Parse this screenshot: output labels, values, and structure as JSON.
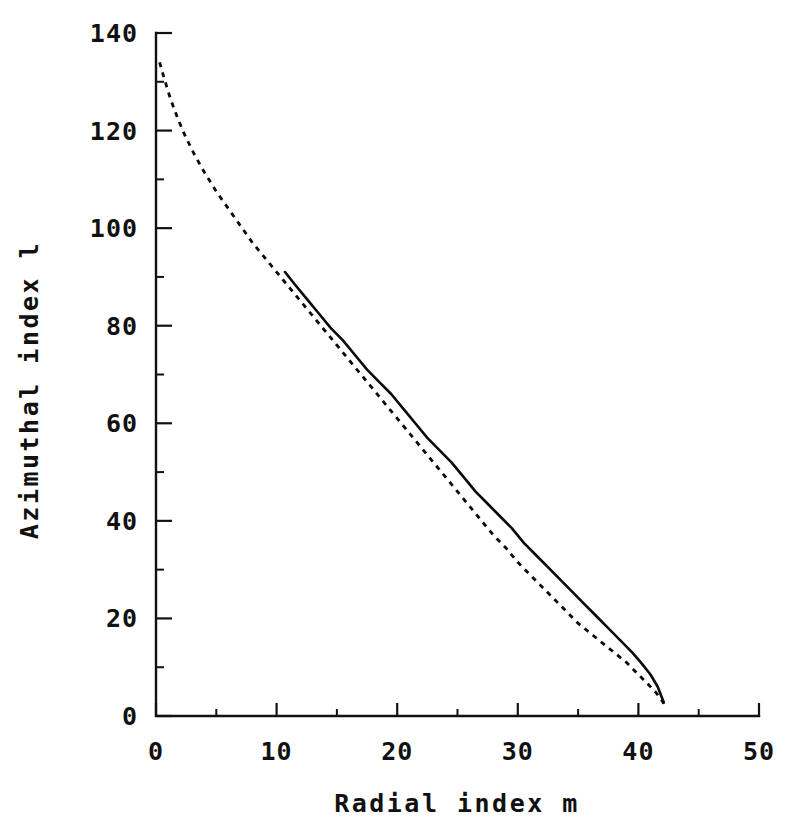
{
  "chart_data": {
    "type": "line",
    "title": "",
    "xlabel": "Radial index m",
    "ylabel": "Azimuthal index l",
    "xlim": [
      0,
      50
    ],
    "ylim": [
      0,
      140
    ],
    "xticks": [
      "0",
      "10",
      "20",
      "30",
      "40",
      "50"
    ],
    "xtick_values": [
      0,
      10,
      20,
      30,
      40,
      50
    ],
    "xminor_values": [
      5,
      15,
      25,
      35,
      45
    ],
    "yticks": [
      "0",
      "20",
      "40",
      "60",
      "80",
      "100",
      "120",
      "140"
    ],
    "ytick_values": [
      0,
      20,
      40,
      60,
      80,
      100,
      120,
      140
    ],
    "yminor_values": [
      10,
      30,
      50,
      70,
      90,
      110,
      130
    ],
    "grid": false,
    "legend": "none",
    "series": [
      {
        "name": "dashed-curve",
        "style": "dashed",
        "x": [
          0.3,
          0.7,
          1.2,
          1.8,
          2.4,
          3.2,
          4.0,
          5.0,
          6.0,
          7.0,
          8.0,
          9.0,
          10.0,
          11.0,
          12.0,
          13.0,
          14.0,
          15.0,
          16.0,
          17.0,
          18.0,
          19.0,
          20.0,
          21.0,
          22.0,
          23.0,
          24.0,
          25.0,
          26.0,
          27.0,
          28.0,
          29.0,
          30.0,
          31.0,
          32.0,
          33.0,
          34.0,
          35.0,
          36.0,
          37.0,
          38.0,
          39.0,
          40.0,
          40.8,
          41.4,
          42.0,
          42.2
        ],
        "y": [
          134.0,
          130.5,
          126.5,
          122.5,
          119.0,
          115.0,
          111.5,
          107.5,
          104.0,
          100.5,
          97.0,
          94.0,
          91.0,
          88.0,
          85.0,
          82.0,
          79.0,
          76.0,
          73.0,
          70.0,
          67.0,
          64.0,
          61.0,
          58.0,
          55.0,
          52.0,
          49.0,
          46.0,
          43.0,
          40.0,
          37.0,
          34.5,
          31.5,
          29.0,
          26.5,
          24.0,
          21.5,
          19.0,
          17.0,
          15.0,
          13.0,
          11.0,
          8.5,
          6.5,
          5.0,
          3.0,
          2.0
        ]
      },
      {
        "name": "solid-curve",
        "style": "solid",
        "x": [
          10.7,
          11.5,
          12.5,
          13.5,
          14.5,
          15.5,
          16.5,
          17.5,
          18.5,
          19.5,
          20.5,
          21.5,
          22.5,
          23.5,
          24.5,
          25.5,
          26.5,
          27.5,
          28.5,
          29.5,
          30.5,
          31.5,
          32.5,
          33.5,
          34.5,
          35.5,
          36.5,
          37.5,
          38.5,
          39.5,
          40.2,
          41.0,
          41.6,
          42.1
        ],
        "y": [
          91.0,
          88.5,
          85.5,
          82.5,
          79.5,
          77.0,
          74.0,
          71.0,
          68.5,
          66.0,
          63.0,
          60.0,
          57.0,
          54.5,
          52.0,
          49.0,
          46.0,
          43.5,
          41.0,
          38.5,
          35.5,
          33.0,
          30.5,
          28.0,
          25.5,
          23.0,
          20.5,
          18.0,
          15.5,
          13.0,
          11.0,
          8.5,
          6.0,
          2.8
        ]
      }
    ],
    "colors": {
      "ink": "#111111",
      "background": "#ffffff"
    }
  }
}
